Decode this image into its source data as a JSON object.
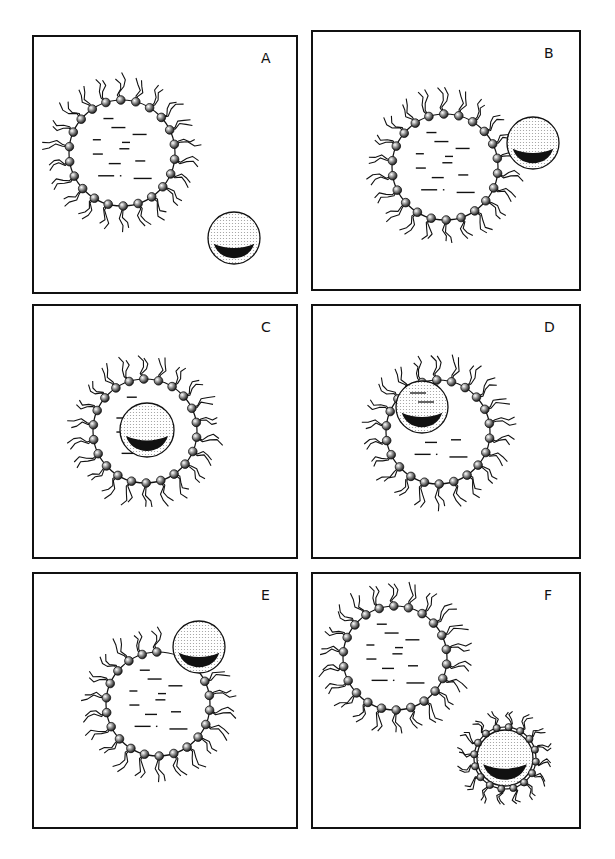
{
  "figure": {
    "colors": {
      "line": "#111111",
      "background": "#ffffff",
      "particle_fill": "#e6e6e6",
      "particle_shadow": "#111111"
    },
    "panels": [
      {
        "label": "A",
        "box": [
          33,
          36,
          264,
          257
        ],
        "vesicle": {
          "cx": 122,
          "cy": 153,
          "r": 53
        },
        "particle": {
          "cx": 234,
          "cy": 238,
          "r": 26,
          "coated": false
        },
        "state": "particle separate"
      },
      {
        "label": "B",
        "box": [
          312,
          31,
          268,
          259
        ],
        "vesicle": {
          "cx": 445,
          "cy": 167,
          "r": 53
        },
        "particle": {
          "cx": 533,
          "cy": 143,
          "r": 26,
          "coated": false
        },
        "state": "particle contacts vesicle"
      },
      {
        "label": "C",
        "box": [
          33,
          305,
          264,
          253
        ],
        "vesicle": {
          "cx": 145,
          "cy": 431,
          "r": 52
        },
        "particle": {
          "cx": 147,
          "cy": 430,
          "r": 27,
          "coated": false
        },
        "state": "particle inside vesicle (center)"
      },
      {
        "label": "D",
        "box": [
          312,
          305,
          268,
          253
        ],
        "vesicle": {
          "cx": 438,
          "cy": 432,
          "r": 52
        },
        "particle": {
          "cx": 422,
          "cy": 407,
          "r": 26,
          "coated": false
        },
        "state": "particle inside vesicle (upper left)"
      },
      {
        "label": "E",
        "box": [
          33,
          573,
          264,
          255
        ],
        "vesicle": {
          "cx": 158,
          "cy": 704,
          "r": 52
        },
        "particle": {
          "cx": 199,
          "cy": 647,
          "r": 26,
          "coated": false
        },
        "state": "particle exiting vesicle"
      },
      {
        "label": "F",
        "box": [
          312,
          573,
          268,
          255
        ],
        "vesicle": {
          "cx": 395,
          "cy": 658,
          "r": 52
        },
        "particle": {
          "cx": 505,
          "cy": 758,
          "r": 28,
          "coated": true
        },
        "state": "particle released with coating"
      }
    ]
  }
}
